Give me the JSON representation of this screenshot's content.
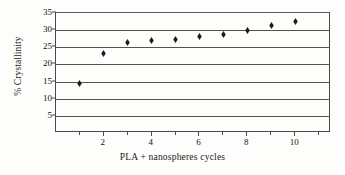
{
  "chart_data": {
    "type": "scatter",
    "title": "",
    "xlabel": "PLA + nanospheres cycles",
    "ylabel": "% Crystallinity",
    "xlim": [
      0,
      11.5
    ],
    "ylim": [
      0,
      35
    ],
    "grid": true,
    "legend": false,
    "marker": "diamond",
    "marker_color": "#1c1c1c",
    "x": [
      1,
      2,
      3,
      4,
      5,
      6,
      7,
      8,
      9,
      10
    ],
    "values": [
      14.4,
      23.1,
      26.5,
      27.0,
      27.4,
      28.2,
      28.6,
      30.0,
      31.3,
      32.5
    ],
    "xticks": [
      {
        "value": 1,
        "label": ""
      },
      {
        "value": 2,
        "label": "2"
      },
      {
        "value": 3,
        "label": ""
      },
      {
        "value": 4,
        "label": "4"
      },
      {
        "value": 5,
        "label": ""
      },
      {
        "value": 6,
        "label": "6"
      },
      {
        "value": 7,
        "label": ""
      },
      {
        "value": 8,
        "label": "8"
      },
      {
        "value": 9,
        "label": ""
      },
      {
        "value": 10,
        "label": "10"
      },
      {
        "value": 11,
        "label": ""
      }
    ],
    "yticks": [
      {
        "value": 5,
        "label": "5"
      },
      {
        "value": 10,
        "label": "10"
      },
      {
        "value": 15,
        "label": "15"
      },
      {
        "value": 20,
        "label": "20"
      },
      {
        "value": 25,
        "label": "25"
      },
      {
        "value": 30,
        "label": "30"
      },
      {
        "value": 35,
        "label": "35"
      }
    ],
    "gridlines": [
      5,
      10,
      15,
      20,
      25,
      30
    ],
    "axis_color": "#4a4a4a",
    "grid_color": "#55524f",
    "background": "#fdfdfb"
  }
}
